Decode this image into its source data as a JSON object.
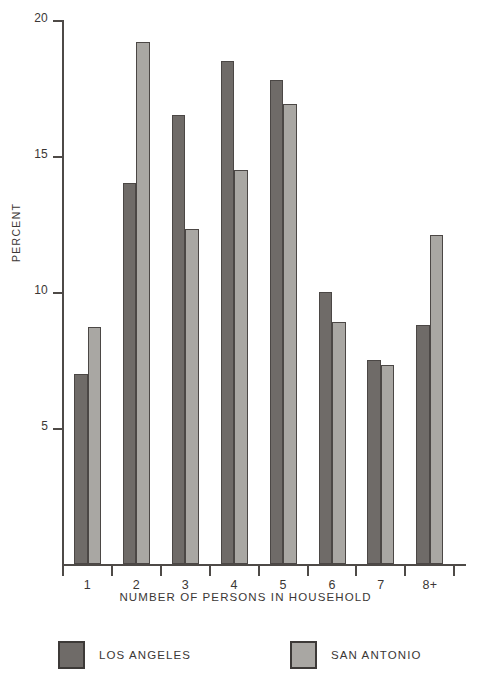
{
  "chart_data": {
    "type": "bar",
    "title": "",
    "subtitle": "",
    "xlabel": "NUMBER OF PERSONS IN HOUSEHOLD",
    "ylabel": "PERCENT",
    "categories": [
      "1",
      "2",
      "3",
      "4",
      "5",
      "6",
      "7",
      "8+"
    ],
    "series": [
      {
        "name": "LOS ANGELES",
        "color": "#6f6b68",
        "values": [
          7.0,
          14.0,
          16.5,
          18.5,
          17.8,
          10.0,
          7.5,
          8.8
        ]
      },
      {
        "name": "SAN ANTONIO",
        "color": "#a9a7a3",
        "values": [
          8.7,
          19.2,
          12.3,
          14.5,
          16.9,
          8.9,
          7.3,
          12.1
        ]
      }
    ],
    "ylim": [
      0,
      20
    ],
    "yticks": [
      5,
      10,
      15,
      20
    ],
    "ytick_labels": [
      "5",
      "10",
      "15",
      "20"
    ],
    "grid": false,
    "legend_position": "bottom"
  },
  "legend": {
    "entries": [
      {
        "label": "LOS ANGELES",
        "color": "#6f6b68"
      },
      {
        "label": "SAN ANTONIO",
        "color": "#a9a7a3"
      }
    ]
  },
  "colors": {
    "background": "#ffffff",
    "axis": "#4e4a47",
    "text": "#3b3735",
    "los_angeles": "#6f6b68",
    "san_antonio": "#a9a7a3"
  }
}
